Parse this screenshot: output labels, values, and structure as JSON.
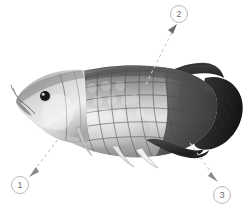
{
  "figure": {
    "background_color": "#ffffff",
    "width": 252,
    "height": 212
  },
  "callouts": [
    {
      "label": "1",
      "name": "callout-marker-1",
      "circle": {
        "x": 11,
        "y": 176,
        "d": 18
      },
      "leader": {
        "x1": 72,
        "y1": 121,
        "x2": 33,
        "y2": 172
      },
      "arrow": {
        "x": 31,
        "y": 174,
        "angle": 128
      },
      "target": "lower-body-pelvic-region"
    },
    {
      "label": "2",
      "name": "callout-marker-2",
      "circle": {
        "x": 170,
        "y": 5,
        "d": 18
      },
      "leader": {
        "x1": 146,
        "y1": 84,
        "x2": 174,
        "y2": 28
      },
      "arrow": {
        "x": 176,
        "y": 26,
        "angle": -63
      },
      "target": "dorsal-back-scales"
    },
    {
      "label": "3",
      "name": "callout-marker-3",
      "circle": {
        "x": 213,
        "y": 186,
        "d": 18
      },
      "leader": {
        "x1": 190,
        "y1": 143,
        "x2": 215,
        "y2": 178
      },
      "arrow": {
        "x": 217,
        "y": 181,
        "angle": 55
      },
      "target": "anal-fin-caudal-region"
    }
  ],
  "colors": {
    "callout_border": "#b9b9b9",
    "callout_text": "#6e6e6e",
    "leader_line": "#c8c8c8",
    "arrow_fill": "#808080",
    "fish_dark": "#2b2b2b",
    "fish_mid": "#8a8a8a",
    "fish_light": "#d8d8d8",
    "fish_highlight": "#f2f2f2",
    "eye": "#1a1a1a"
  },
  "fish_parts": {
    "head": "head",
    "eye": "eye",
    "barbels": "barbels",
    "body_scales": "body-scales",
    "pectoral_fin": "pectoral-fin",
    "pelvic_fin": "pelvic-fin",
    "anal_fin": "anal-fin",
    "dorsal_fin": "dorsal-fin",
    "caudal_fin": "caudal-fin"
  }
}
